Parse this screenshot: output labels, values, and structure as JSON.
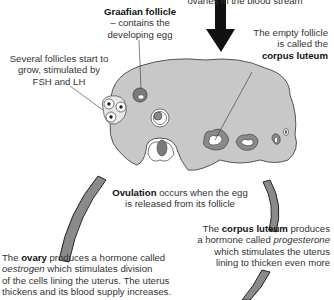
{
  "diagram": {
    "colors": {
      "ovary_fill": "#c8c8c8",
      "ovary_stroke": "#555555",
      "follicle_dark": "#7a7a7a",
      "arc_fill": "#8a8a8a",
      "arc_stroke": "#222222",
      "arrow": "#111111",
      "text": "#333333"
    },
    "labels": {
      "top_cut": "ovaries in the blood stream",
      "graafian_title": "Graafian follicle",
      "graafian_line1": "– contains the",
      "graafian_line2": "developing egg",
      "several_line1": "Several follicles start to",
      "several_line2": "grow, stimulated by",
      "several_line3": "FSH and LH",
      "empty_line1": "The empty follicle",
      "empty_line2": "is called the",
      "empty_bold": "corpus luteum",
      "ovulation_bold": "Ovulation",
      "ovulation_rest": " occurs when the egg",
      "ovulation_line2": "is released from its follicle",
      "cl_pre": "The ",
      "cl_bold": "corpus luteum",
      "cl_post": " produces",
      "cl_line2_pre": "a hormone called ",
      "cl_line2_italic": "progesterone",
      "cl_line3": "which stimulates the uterus",
      "cl_line4": "lining to thicken even more",
      "ov_pre": "The ",
      "ov_bold": "ovary",
      "ov_post": " produces a hormone called",
      "ov_line2_italic": "oestrogen",
      "ov_line2_rest": " which stimulates division",
      "ov_line3": "of the cells lining the uterus. The uterus",
      "ov_line4": "thickens and its blood supply increases."
    }
  }
}
